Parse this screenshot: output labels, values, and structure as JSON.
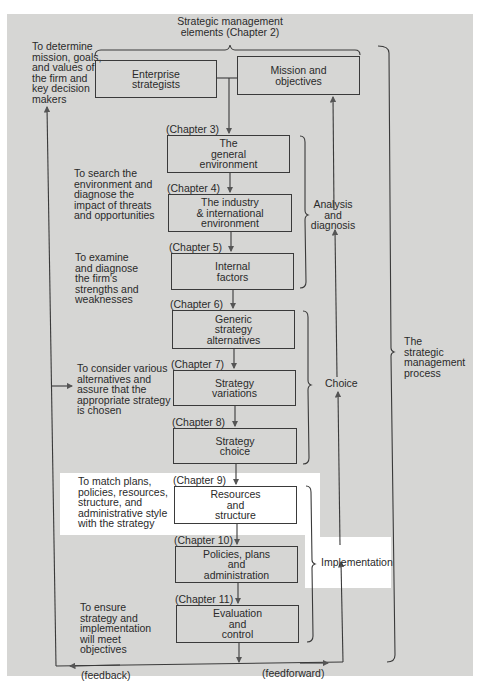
{
  "diagram": {
    "header": {
      "title": "Strategic management\nelements (Chapter 2)"
    },
    "purposes": {
      "determine": "To determine\nmission, goals,\nand values of\nthe firm and\nkey decision\nmakers",
      "search": "To search the\nenvironment and\ndiagnose the\nimpact of threats\nand opportunities",
      "examine": "To examine\nand diagnose\nthe firm's\nstrengths and\nweaknesses",
      "consider": "To consider various\nalternatives and\nassure that the\nappropriate strategy\nis chosen",
      "match": "To match plans,\npolicies, resources,\nstructure, and\nadministrative style\nwith the strategy",
      "ensure": "To ensure\nstrategy and\nimplementation\nwill meet\nobjectives"
    },
    "elements": {
      "enterprise_strategists": "Enterprise\nstrategists",
      "mission_objectives": "Mission and\nobjectives"
    },
    "steps": [
      {
        "chapter": "(Chapter 3)",
        "label": "The\ngeneral\nenvironment"
      },
      {
        "chapter": "(Chapter 4)",
        "label": "The industry\n& international\nenvironment"
      },
      {
        "chapter": "(Chapter 5)",
        "label": "Internal\nfactors"
      },
      {
        "chapter": "(Chapter 6)",
        "label": "Generic\nstrategy\nalternatives"
      },
      {
        "chapter": "(Chapter 7)",
        "label": "Strategy\nvariations"
      },
      {
        "chapter": "(Chapter 8)",
        "label": "Strategy\nchoice"
      },
      {
        "chapter": "(Chapter 9)",
        "label": "Resources\nand\nstructure"
      },
      {
        "chapter": "(Chapter 10)",
        "label": "Policies, plans\nand\nadministration"
      },
      {
        "chapter": "(Chapter 11)",
        "label": "Evaluation\nand\ncontrol"
      }
    ],
    "phases": {
      "analysis": "Analysis\nand\ndiagnosis",
      "choice": "Choice",
      "implementation": "Implementation",
      "process": "The\nstrategic\nmanagement\nprocess"
    },
    "flows": {
      "feedback": "(feedback)",
      "feedforward": "(feedforward)"
    },
    "colors": {
      "panel": "#d6d6d4",
      "highlight": "#ffffff",
      "line": "#3a3a3a"
    }
  }
}
